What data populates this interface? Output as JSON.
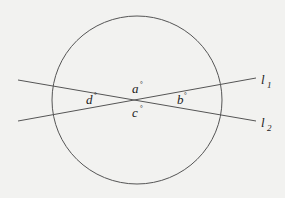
{
  "diagram": {
    "type": "geometry",
    "colors": {
      "background": "#f2f2f0",
      "stroke": "#555555",
      "text": "#222222"
    },
    "circle": {
      "cx": 137,
      "cy": 100,
      "rx": 85,
      "ry": 84
    },
    "lines": [
      {
        "name": "l1",
        "label": "l",
        "subscript": "1",
        "x1": 18,
        "y1": 121,
        "x2": 256,
        "y2": 78
      },
      {
        "name": "l2",
        "label": "l",
        "subscript": "2",
        "x1": 18,
        "y1": 80,
        "x2": 256,
        "y2": 121
      }
    ],
    "angles": [
      {
        "name": "a",
        "label": "a",
        "unit": "°"
      },
      {
        "name": "b",
        "label": "b",
        "unit": "°"
      },
      {
        "name": "c",
        "label": "c",
        "unit": "°"
      },
      {
        "name": "d",
        "label": "d",
        "unit": "°"
      }
    ]
  }
}
